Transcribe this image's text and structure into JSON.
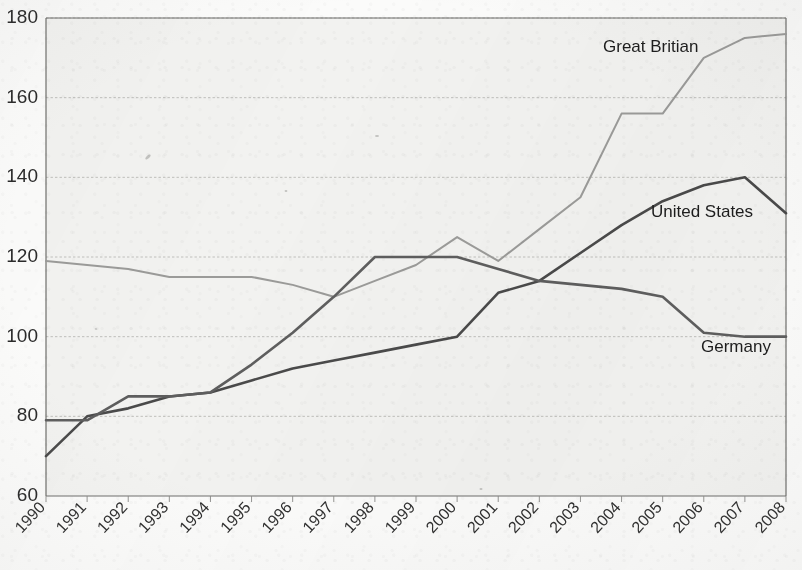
{
  "chart_data": {
    "type": "line",
    "title": "",
    "subtitle": "",
    "xlabel": "",
    "ylabel": "",
    "x": [
      1990,
      1991,
      1992,
      1993,
      1994,
      1995,
      1996,
      1997,
      1998,
      1999,
      2000,
      2001,
      2002,
      2003,
      2004,
      2005,
      2006,
      2007,
      2008
    ],
    "categories": [
      "1990",
      "1991",
      "1992",
      "1993",
      "1994",
      "1995",
      "1996",
      "1997",
      "1998",
      "1999",
      "2000",
      "2001",
      "2002",
      "2003",
      "2004",
      "2005",
      "2006",
      "2007",
      "2008"
    ],
    "xlim": [
      1990,
      2008
    ],
    "ylim": [
      60,
      180
    ],
    "yticks": [
      60,
      80,
      100,
      120,
      140,
      160,
      180
    ],
    "xticks": [
      "1990",
      "1991",
      "1992",
      "1993",
      "1994",
      "1995",
      "1996",
      "1997",
      "1998",
      "1999",
      "2000",
      "2001",
      "2002",
      "2003",
      "2004",
      "2005",
      "2006",
      "2007",
      "2008"
    ],
    "grid": "horizontal-dashed",
    "legend": "inline-annotations",
    "series": [
      {
        "name": "Great Britian",
        "color": "#9b9b99",
        "values": [
          119,
          118,
          117,
          115,
          115,
          115,
          113,
          110,
          114,
          118,
          125,
          119,
          127,
          135,
          156,
          156,
          170,
          175,
          176
        ]
      },
      {
        "name": "United States",
        "color": "#4a4a4a",
        "values": [
          70,
          80,
          82,
          85,
          86,
          89,
          92,
          94,
          96,
          98,
          100,
          111,
          114,
          121,
          128,
          134,
          138,
          140,
          131
        ]
      },
      {
        "name": "Germany",
        "color": "#5e5e5e",
        "values": [
          79,
          79,
          85,
          85,
          86,
          93,
          101,
          110,
          120,
          120,
          120,
          117,
          114,
          113,
          112,
          110,
          101,
          100,
          100
        ]
      }
    ],
    "annotations": [
      {
        "label": "Great Britian",
        "x_px": 603,
        "y_px": 52
      },
      {
        "label": "United States",
        "x_px": 651,
        "y_px": 217
      },
      {
        "label": "Germany",
        "x_px": 701,
        "y_px": 352
      }
    ]
  },
  "axes": {
    "y_tick_labels": [
      "180",
      "160",
      "140",
      "120",
      "100",
      "80",
      "60"
    ],
    "x_tick_labels": [
      "1990",
      "1991",
      "1992",
      "1993",
      "1994",
      "1995",
      "1996",
      "1997",
      "1998",
      "1999",
      "2000",
      "2001",
      "2002",
      "2003",
      "2004",
      "2005",
      "2006",
      "2007",
      "2008"
    ]
  },
  "colors": {
    "background": "#fbfbfa",
    "plot_fill": "#f2f2f0",
    "grid": "#b9b9b6",
    "axis": "#6f6f6d",
    "great_britian": "#9b9b99",
    "united_states": "#4a4a4a",
    "germany": "#5e5e5e"
  }
}
